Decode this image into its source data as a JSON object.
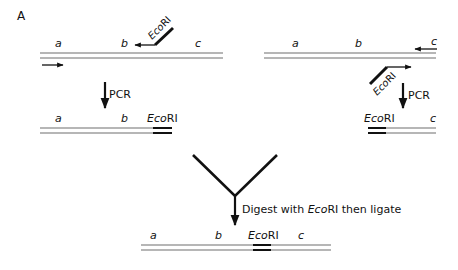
{
  "panel_label": "A",
  "colors": {
    "line": "#6e6e6e",
    "ink": "#111111",
    "background": "#ffffff"
  },
  "top_left": {
    "labels": {
      "a": "a",
      "b": "b",
      "c": "c"
    },
    "primer_label_italic": "Eco",
    "primer_label_roman": "RI",
    "description": "Template DNA with forward primer and reverse primer carrying EcoRI site"
  },
  "top_right": {
    "labels": {
      "a": "a",
      "b": "b",
      "c": "c"
    },
    "primer_label_italic": "Eco",
    "primer_label_roman": "RI",
    "description": "Template DNA with reverse primer and forward primer carrying EcoRI site"
  },
  "pcr_left": {
    "label": "PCR"
  },
  "pcr_right": {
    "label": "PCR"
  },
  "product_left": {
    "labels": {
      "a": "a",
      "b": "b"
    },
    "site_italic": "Eco",
    "site_roman": "RI"
  },
  "product_right": {
    "labels": {
      "c": "c"
    },
    "site_italic": "Eco",
    "site_roman": "RI"
  },
  "merge_step": {
    "text_before": "Digest with ",
    "text_italic": "Eco",
    "text_after": "RI then ligate"
  },
  "final_product": {
    "labels": {
      "a": "a",
      "b": "b",
      "c": "c"
    },
    "site_italic": "Eco",
    "site_roman": "RI"
  }
}
